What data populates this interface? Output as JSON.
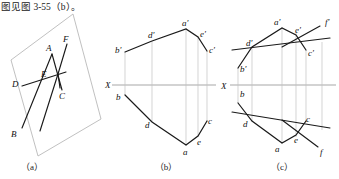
{
  "caption": "图见图 3-55（b）。",
  "panels": [
    {
      "key": "a",
      "label": "（a）",
      "title": "pictorial-view"
    },
    {
      "key": "b",
      "label": "（b）",
      "title": "two-view-projection"
    },
    {
      "key": "c",
      "label": "（c）",
      "title": "two-view-projection-with-line-f"
    }
  ],
  "panel_a": {
    "axis_label": "",
    "points": [
      {
        "name": "A",
        "label": "A",
        "x": 49,
        "y": 47
      },
      {
        "name": "F",
        "label": "F",
        "x": 66,
        "y": 38
      },
      {
        "name": "E",
        "label": "E",
        "x": 45,
        "y": 73
      },
      {
        "name": "D",
        "label": "D",
        "x": 16,
        "y": 83
      },
      {
        "name": "B",
        "label": "B",
        "x": 14,
        "y": 133
      },
      {
        "name": "C",
        "label": "C",
        "x": 62,
        "y": 95
      }
    ]
  },
  "panel_b": {
    "axis_label": "X",
    "upper_points": [
      {
        "name": "a-prime",
        "label": "a′",
        "x": 74,
        "y": 27
      },
      {
        "name": "e-prime",
        "label": "e′",
        "x": 86,
        "y": 36
      },
      {
        "name": "d-prime",
        "label": "d′",
        "x": 41,
        "y": 38
      },
      {
        "name": "b-prime",
        "label": "b′",
        "x": 13,
        "y": 51
      },
      {
        "name": "c-prime",
        "label": "c′",
        "x": 95,
        "y": 52
      }
    ],
    "lower_points": [
      {
        "name": "b",
        "label": "b",
        "x": 12,
        "y": 96
      },
      {
        "name": "d",
        "label": "d",
        "x": 37,
        "y": 122
      },
      {
        "name": "a",
        "label": "a",
        "x": 73,
        "y": 145
      },
      {
        "name": "e",
        "label": "e",
        "x": 86,
        "y": 135
      },
      {
        "name": "c",
        "label": "c",
        "x": 95,
        "y": 120
      }
    ]
  },
  "panel_c": {
    "axis_label": "X",
    "upper_points": [
      {
        "name": "a-prime",
        "label": "a′",
        "x": 65,
        "y": 25
      },
      {
        "name": "f-prime",
        "label": "f′",
        "x": 112,
        "y": 23
      },
      {
        "name": "e-prime",
        "label": "e′",
        "x": 83,
        "y": 34
      },
      {
        "name": "d-prime",
        "label": "d′",
        "x": 35,
        "y": 44
      },
      {
        "name": "c-prime",
        "label": "c′",
        "x": 92,
        "y": 52
      },
      {
        "name": "b-prime",
        "label": "b′",
        "x": 19,
        "y": 67
      }
    ],
    "lower_points": [
      {
        "name": "b",
        "label": "b",
        "x": 19,
        "y": 88
      },
      {
        "name": "d",
        "label": "d",
        "x": 33,
        "y": 121
      },
      {
        "name": "c",
        "label": "c",
        "x": 92,
        "y": 119
      },
      {
        "name": "e",
        "label": "e",
        "x": 83,
        "y": 135
      },
      {
        "name": "a",
        "label": "a",
        "x": 63,
        "y": 142
      },
      {
        "name": "f",
        "label": "f",
        "x": 110,
        "y": 151
      }
    ]
  },
  "style": {
    "line_color": "#1a1a1a",
    "thin_color": "#9a9a9a",
    "axis_color": "#9a9a9a",
    "background": "#ffffff"
  }
}
